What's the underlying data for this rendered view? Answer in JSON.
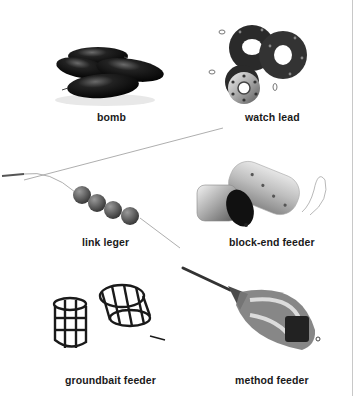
{
  "items": [
    {
      "id": "bomb",
      "label": "bomb",
      "icon": "bomb-weight-icon"
    },
    {
      "id": "watch-lead",
      "label": "watch lead",
      "icon": "watch-lead-weight-icon"
    },
    {
      "id": "link-leger",
      "label": "link leger",
      "icon": "link-leger-icon"
    },
    {
      "id": "block-end-feeder",
      "label": "block-end feeder",
      "icon": "block-end-feeder-icon"
    },
    {
      "id": "groundbait-feeder",
      "label": "groundbait feeder",
      "icon": "groundbait-feeder-icon"
    },
    {
      "id": "method-feeder",
      "label": "method feeder",
      "icon": "method-feeder-icon"
    }
  ],
  "colors": {
    "background": "#ffffff",
    "text": "#1a1a1a",
    "edge": "#c8c8c8"
  }
}
